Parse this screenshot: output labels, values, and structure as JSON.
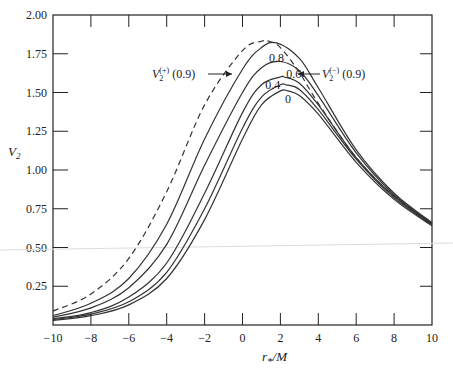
{
  "chart_data": {
    "type": "line",
    "title": "",
    "xlabel": "r*/M",
    "ylabel": "V2",
    "xlim": [
      -10,
      10
    ],
    "ylim": [
      0,
      2.0
    ],
    "xticks": [
      -10,
      -8,
      -6,
      -4,
      -2,
      0,
      2,
      4,
      6,
      8,
      10
    ],
    "xtick_labels": [
      "−10",
      "−8",
      "−6",
      "−4",
      "−2",
      "0",
      "2",
      "4",
      "6",
      "8",
      "10"
    ],
    "yticks": [
      0.25,
      0.5,
      0.75,
      1.0,
      1.25,
      1.5,
      1.75,
      2.0
    ],
    "ytick_labels": [
      "0.25",
      "0.50",
      "0.75",
      "1.00",
      "1.25",
      "1.50",
      "1.75",
      "2.00"
    ],
    "grid": false,
    "series": [
      {
        "name": "0",
        "style": "solid",
        "label": "0",
        "x": [
          -10,
          -8,
          -6,
          -4,
          -2,
          0,
          1,
          2,
          2.4,
          3,
          4,
          6,
          8,
          10
        ],
        "y": [
          0.03,
          0.06,
          0.13,
          0.3,
          0.68,
          1.2,
          1.42,
          1.51,
          1.51,
          1.48,
          1.36,
          1.05,
          0.81,
          0.64
        ]
      },
      {
        "name": "0.4",
        "style": "solid",
        "label": "0.4",
        "x": [
          -10,
          -8,
          -6,
          -4,
          -2,
          0,
          1,
          2,
          2.3,
          3,
          4,
          6,
          8,
          10
        ],
        "y": [
          0.035,
          0.07,
          0.15,
          0.34,
          0.75,
          1.27,
          1.47,
          1.55,
          1.55,
          1.52,
          1.39,
          1.07,
          0.82,
          0.645
        ]
      },
      {
        "name": "0.6",
        "style": "solid",
        "label": "0.6",
        "x": [
          -10,
          -8,
          -6,
          -4,
          -2,
          0,
          1,
          2,
          2.2,
          3,
          4,
          6,
          8,
          10
        ],
        "y": [
          0.04,
          0.08,
          0.18,
          0.4,
          0.85,
          1.37,
          1.55,
          1.6,
          1.6,
          1.56,
          1.42,
          1.08,
          0.83,
          0.65
        ]
      },
      {
        "name": "0.8",
        "style": "solid",
        "label": "0.8",
        "x": [
          -10,
          -8,
          -6,
          -4,
          -2,
          0,
          1,
          2,
          3,
          4,
          6,
          8,
          10
        ],
        "y": [
          0.05,
          0.11,
          0.24,
          0.52,
          1.03,
          1.5,
          1.66,
          1.7,
          1.64,
          1.48,
          1.11,
          0.84,
          0.655
        ]
      },
      {
        "name": "V2(-) (0.9)",
        "style": "solid",
        "label": "",
        "x": [
          -10,
          -8,
          -6,
          -4,
          -2,
          0,
          1,
          1.8,
          3,
          4,
          6,
          8,
          10
        ],
        "y": [
          0.06,
          0.14,
          0.3,
          0.65,
          1.2,
          1.65,
          1.79,
          1.82,
          1.72,
          1.53,
          1.13,
          0.85,
          0.66
        ]
      },
      {
        "name": "V2(+) (0.9)",
        "style": "dashed",
        "label": "",
        "x": [
          -10,
          -8,
          -6,
          -4,
          -2,
          0,
          1,
          1.4,
          2,
          3,
          4,
          6,
          8,
          10
        ],
        "y": [
          0.09,
          0.2,
          0.43,
          0.86,
          1.42,
          1.77,
          1.83,
          1.83,
          1.79,
          1.63,
          1.43,
          1.08,
          0.83,
          0.65
        ]
      }
    ],
    "annotations": [
      {
        "text_main": "V",
        "sub": "2",
        "sup": "(+)",
        "suffix": " (0.9)",
        "side": "left",
        "target": "V2(+) (0.9)"
      },
      {
        "text_main": "V",
        "sub": "2",
        "sup": "(−)",
        "suffix": " (0.9)",
        "side": "right",
        "target": "V2(-) (0.9)"
      }
    ]
  }
}
